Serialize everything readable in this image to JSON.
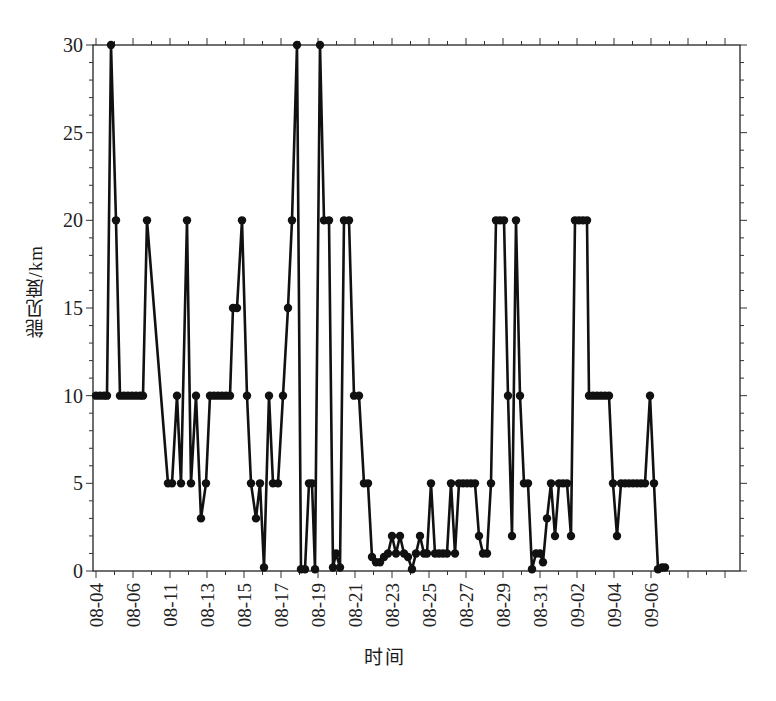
{
  "chart_data": {
    "type": "line",
    "title": "",
    "xlabel": "时间",
    "ylabel": "能见度/km",
    "ylim": [
      0,
      30
    ],
    "yticks": [
      0,
      5,
      10,
      15,
      20,
      25,
      30
    ],
    "y_minor_step": 1,
    "x_tick_labels": [
      "08-04",
      "08-06",
      "08-11",
      "08-13",
      "08-15",
      "08-17",
      "08-19",
      "08-21",
      "08-23",
      "08-25",
      "08-27",
      "08-29",
      "08-31",
      "09-02",
      "09-04",
      "09-06"
    ],
    "grid": false,
    "legend": null,
    "marker": "filled-circle",
    "line_color": "#111111",
    "series": [
      {
        "name": "能见度",
        "points_px_x": [
          96,
          100,
          104,
          107,
          111,
          116,
          120,
          124,
          128,
          132,
          136,
          140,
          143,
          147,
          168,
          172,
          177,
          181,
          187,
          191,
          196,
          201,
          206,
          210,
          214,
          218,
          222,
          226,
          230,
          233,
          237,
          242,
          247,
          251,
          256,
          260,
          264,
          269,
          273,
          278,
          283,
          288,
          292,
          297,
          301,
          305,
          309,
          312,
          315,
          320,
          324,
          329,
          333,
          336,
          340,
          344,
          349,
          354,
          359,
          364,
          368,
          372,
          376,
          380,
          384,
          388,
          392,
          396,
          400,
          404,
          408,
          412,
          416,
          420,
          424,
          427,
          431,
          435,
          439,
          443,
          447,
          451,
          455,
          459,
          463,
          467,
          471,
          475,
          479,
          483,
          487,
          491,
          496,
          500,
          504,
          508,
          512,
          516,
          520,
          524,
          528,
          532,
          536,
          540,
          543,
          547,
          551,
          555,
          559,
          563,
          567,
          571,
          575,
          579,
          583,
          587,
          589,
          593,
          597,
          601,
          605,
          609,
          613,
          617,
          621,
          625,
          629,
          633,
          637,
          641,
          645,
          650,
          654,
          658,
          662,
          665
        ],
        "values": [
          10,
          10,
          10,
          10,
          30,
          20,
          10,
          10,
          10,
          10,
          10,
          10,
          10,
          20,
          5,
          5,
          10,
          5,
          20,
          5,
          10,
          3,
          5,
          10,
          10,
          10,
          10,
          10,
          10,
          15,
          15,
          20,
          10,
          5,
          3,
          5,
          0.2,
          10,
          5,
          5,
          10,
          15,
          20,
          30,
          0.1,
          0.1,
          5,
          5,
          0.1,
          30,
          20,
          20,
          0.2,
          1,
          0.2,
          20,
          20,
          10,
          10,
          5,
          5,
          0.8,
          0.5,
          0.5,
          0.8,
          1,
          2,
          1,
          2,
          1,
          0.8,
          0.1,
          1,
          2,
          1,
          1,
          5,
          1,
          1,
          1,
          1,
          5,
          1,
          5,
          5,
          5,
          5,
          5,
          2,
          1,
          1,
          5,
          20,
          20,
          20,
          10,
          2,
          20,
          10,
          5,
          5,
          0.1,
          1,
          1,
          0.5,
          3,
          5,
          2,
          5,
          5,
          5,
          2,
          20,
          20,
          20,
          20,
          10,
          10,
          10,
          10,
          10,
          10,
          5,
          2,
          5,
          5,
          5,
          5,
          5,
          5,
          5,
          10,
          5,
          0.1,
          0.2,
          0.2
        ]
      }
    ]
  },
  "axes": {
    "frame": {
      "left": 93,
      "top": 45,
      "right": 740,
      "bottom": 571
    },
    "x_tick_first_px": 96,
    "x_tick_label_spacing_px": 37
  }
}
